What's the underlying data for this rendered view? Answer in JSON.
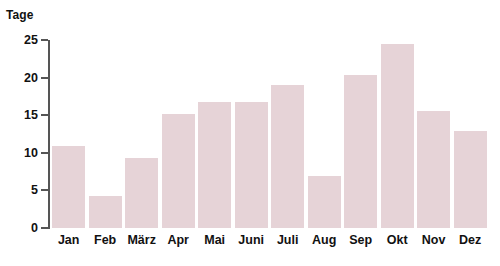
{
  "chart_data": {
    "type": "bar",
    "title": "",
    "xlabel": "",
    "ylabel": "Tage",
    "categories": [
      "Jan",
      "Feb",
      "März",
      "Apr",
      "Mai",
      "Juni",
      "Juli",
      "Aug",
      "Sep",
      "Okt",
      "Nov",
      "Dez"
    ],
    "values": [
      10.9,
      4.2,
      9.3,
      15.1,
      16.8,
      16.8,
      19.0,
      6.9,
      20.4,
      24.5,
      15.5,
      12.9
    ],
    "ylim": [
      0,
      25
    ],
    "ytick_labels": [
      "0",
      "5",
      "10",
      "15",
      "20",
      "25"
    ],
    "ytick_values": [
      0,
      5,
      10,
      15,
      20,
      25
    ],
    "grid": false,
    "legend": false,
    "bar_color": "#e6d3d7",
    "axis_color": "#555555",
    "text_color": "#111111"
  },
  "axis": {
    "y_title": "Tage"
  }
}
